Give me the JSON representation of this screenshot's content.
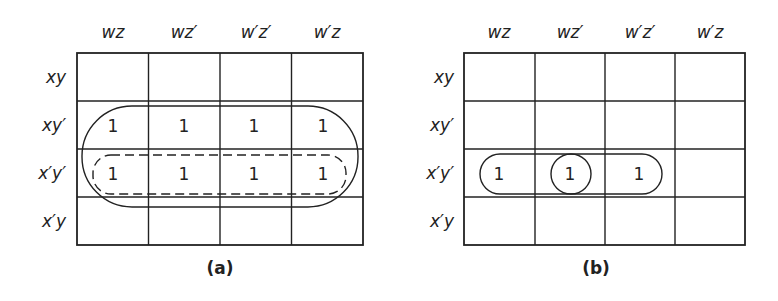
{
  "maps": [
    {
      "caption": "(a)",
      "col_headers": [
        "wz",
        "wz′",
        "w′z′",
        "w′z"
      ],
      "row_headers": [
        "xy",
        "xy′",
        "x′y′",
        "x′y"
      ],
      "cells": [
        [
          "",
          "",
          "",
          ""
        ],
        [
          "1",
          "1",
          "1",
          "1"
        ],
        [
          "1",
          "1",
          "1",
          "1"
        ],
        [
          "",
          "",
          "",
          ""
        ]
      ],
      "groupings": [
        {
          "style": "solid",
          "rows": [
            "xy′",
            "x′y′"
          ],
          "cols": "all"
        },
        {
          "style": "dashed",
          "rows": [
            "x′y′"
          ],
          "cols": "all"
        }
      ]
    },
    {
      "caption": "(b)",
      "col_headers": [
        "wz",
        "wz′",
        "w′z′",
        "w′z"
      ],
      "row_headers": [
        "xy",
        "xy′",
        "x′y′",
        "x′y"
      ],
      "cells": [
        [
          "",
          "",
          "",
          ""
        ],
        [
          "",
          "",
          "",
          ""
        ],
        [
          "1",
          "1",
          "1",
          ""
        ],
        [
          "",
          "",
          "",
          ""
        ]
      ],
      "groupings": [
        {
          "style": "solid",
          "rows": [
            "x′y′"
          ],
          "cols": [
            "wz",
            "wz′",
            "w′z′"
          ]
        },
        {
          "style": "solid-circle",
          "rows": [
            "x′y′"
          ],
          "cols": [
            "wz′"
          ]
        }
      ]
    }
  ]
}
